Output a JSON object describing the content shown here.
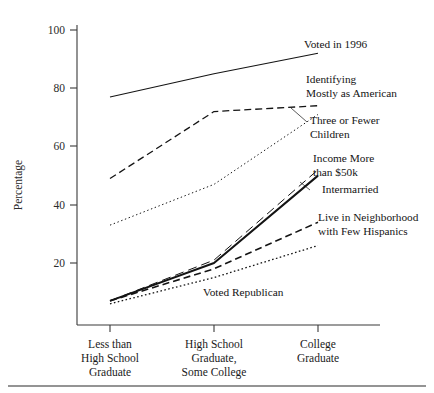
{
  "chart_data": {
    "type": "line",
    "title": "",
    "xlabel": "",
    "ylabel": "Percentage",
    "ylim": [
      0,
      105
    ],
    "yticks": [
      20,
      40,
      60,
      80,
      100
    ],
    "grid": false,
    "legend_position": "inline-right-annotations",
    "categories": [
      "Less than High School Graduate",
      "High School Graduate, Some College",
      "College Graduate"
    ],
    "category_lines": [
      [
        "Less than",
        "High School",
        "Graduate"
      ],
      [
        "High School",
        "Graduate,",
        "Some College"
      ],
      [
        "College",
        "Graduate"
      ]
    ],
    "series": [
      {
        "name": "Voted in 1996",
        "values": [
          77,
          85,
          92
        ],
        "style": "solid",
        "width": 1.1
      },
      {
        "name": "Identifying Mostly as American",
        "values": [
          49,
          72,
          74
        ],
        "style": "dashed",
        "width": 1.3
      },
      {
        "name": "Three or Fewer Children",
        "values": [
          33,
          47,
          71
        ],
        "style": "fine-dotted",
        "width": 1.0
      },
      {
        "name": "Income More than $50k",
        "values": [
          7,
          21,
          52
        ],
        "style": "long-dash",
        "width": 1.0
      },
      {
        "name": "Intermarried",
        "values": [
          7,
          20,
          50
        ],
        "style": "solid-bold",
        "width": 2.0
      },
      {
        "name": "Live in Neighborhood with Few Hispanics",
        "values": [
          7,
          18,
          34
        ],
        "style": "dashed",
        "width": 1.6
      },
      {
        "name": "Voted Republican",
        "values": [
          6,
          15,
          26
        ],
        "style": "dotted",
        "width": 1.3
      }
    ],
    "annotations": [
      {
        "label": "Voted in 1996",
        "lines": [
          "Voted in 1996"
        ]
      },
      {
        "label": "Identifying Mostly as American",
        "lines": [
          "Identifying",
          "Mostly as American"
        ]
      },
      {
        "label": "Three or Fewer Children",
        "lines": [
          "Three or Fewer",
          "Children"
        ]
      },
      {
        "label": "Income More than $50k",
        "lines": [
          "Income More",
          "than $50k"
        ]
      },
      {
        "label": "Intermarried",
        "lines": [
          "Intermarried"
        ]
      },
      {
        "label": "Live in Neighborhood with Few Hispanics",
        "lines": [
          "Live in Neighborhood",
          "with Few Hispanics"
        ]
      },
      {
        "label": "Voted Republican",
        "lines": [
          "Voted Republican"
        ]
      }
    ],
    "colors": {
      "ink": "#141414",
      "axis": "#3a3a3a",
      "background": "#ffffff"
    }
  },
  "axis": {
    "y_title": "Percentage",
    "y_ticks": [
      "100",
      "80",
      "60",
      "40",
      "20"
    ],
    "x_cat_1_l1": "Less than",
    "x_cat_1_l2": "High School",
    "x_cat_1_l3": "Graduate",
    "x_cat_2_l1": "High School",
    "x_cat_2_l2": "Graduate,",
    "x_cat_2_l3": "Some College",
    "x_cat_3_l1": "College",
    "x_cat_3_l2": "Graduate"
  },
  "labels": {
    "voted_1996": "Voted in 1996",
    "identifying_l1": "Identifying",
    "identifying_l2": "Mostly as American",
    "children_l1": "Three or Fewer",
    "children_l2": "Children",
    "income_l1": "Income More",
    "income_l2": "than $50k",
    "intermarried": "Intermarried",
    "hispanics_l1": "Live in Neighborhood",
    "hispanics_l2": "with Few Hispanics",
    "voted_republican": "Voted Republican"
  }
}
